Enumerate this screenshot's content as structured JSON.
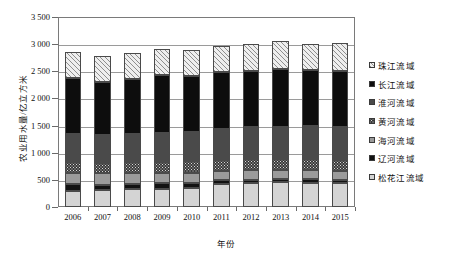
{
  "chart_data": {
    "type": "bar",
    "stacked": true,
    "title": "",
    "xlabel": "年份",
    "ylabel": "农业用水量/亿立方米",
    "ylim": [
      0,
      3500
    ],
    "ytick_step": 500,
    "yticks": [
      "0",
      "500",
      "1 000",
      "1 500",
      "2 000",
      "2 500",
      "3 000",
      "3 500"
    ],
    "grid": true,
    "legend_position": "right",
    "categories": [
      "2006",
      "2007",
      "2008",
      "2009",
      "2010",
      "2011",
      "2012",
      "2013",
      "2014",
      "2015"
    ],
    "series": [
      {
        "name": "松花江流域",
        "key": "songhua",
        "fill": "light-gray",
        "color": "#d4d4d4",
        "values": [
          300,
          310,
          325,
          340,
          355,
          420,
          440,
          455,
          450,
          440
        ]
      },
      {
        "name": "辽河流域",
        "key": "liaohe",
        "fill": "black",
        "color": "#121212",
        "values": [
          115,
          100,
          105,
          95,
          90,
          75,
          65,
          55,
          60,
          60
        ]
      },
      {
        "name": "海河流域",
        "key": "haihe",
        "fill": "medium-gray",
        "color": "#9b9b9b",
        "values": [
          215,
          210,
          200,
          195,
          190,
          175,
          175,
          170,
          175,
          170
        ]
      },
      {
        "name": "黄河流域",
        "key": "huanghe",
        "fill": "dark-dotted",
        "color": "#3a3a3a",
        "values": [
          200,
          195,
          200,
          205,
          205,
          200,
          200,
          200,
          200,
          200
        ]
      },
      {
        "name": "淮河流域",
        "key": "huaihe",
        "fill": "dark-gray",
        "color": "#4a4a4a",
        "values": [
          510,
          510,
          520,
          535,
          550,
          570,
          590,
          600,
          605,
          610
        ]
      },
      {
        "name": "长江流域",
        "key": "changjiang",
        "fill": "black",
        "color": "#0d0d0d",
        "values": [
          1030,
          975,
          1000,
          1055,
          1015,
          1045,
          1040,
          1060,
          1030,
          1030
        ]
      },
      {
        "name": "珠江流域",
        "key": "zhujiang",
        "fill": "hatched",
        "color": "#eeeeee",
        "values": [
          490,
          490,
          490,
          480,
          495,
          490,
          500,
          525,
          490,
          505
        ]
      }
    ],
    "totals": [
      2860,
      2790,
      2840,
      2905,
      2900,
      2975,
      3010,
      3065,
      3010,
      3015
    ],
    "legend_order_top_to_bottom": [
      "珠江流域",
      "长江流域",
      "淮河流域",
      "黄河流域",
      "海河流域",
      "辽河流域",
      "松花江流域"
    ]
  }
}
